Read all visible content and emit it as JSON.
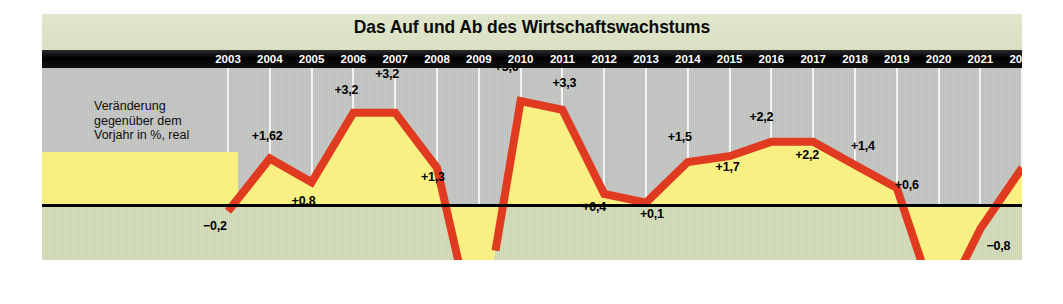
{
  "chart_title": "Das Auf und Ab des Wirtschaftswachstums",
  "legend": {
    "line1": "Veränderung",
    "line2": "gegenüber dem",
    "line3": "Vorjahr in %, real",
    "full": "Veränderung gegenüber dem Vorjahr in %, real"
  },
  "colors": {
    "line": "#e03a20",
    "fill": "#f9f083",
    "upper_background": "#c3c6c3",
    "lower_background": "#d3dcb9",
    "title_band": "#dde4c9",
    "year_bar": "#000000",
    "gridline": "#f2f4f2",
    "zero_line": "#000000",
    "legend_box": "#f7ef80",
    "label_text": "#000000"
  },
  "chart_data": {
    "type": "line",
    "title": "Das Auf und Ab des Wirtschaftswachstums",
    "xlabel": "",
    "ylabel": "Veränderung gegenüber dem Vorjahr in %, real",
    "ylim": [
      -5.4,
      4.2
    ],
    "grid": true,
    "legend_position": "inside-left",
    "categories": [
      "2003",
      "2004",
      "2005",
      "2006",
      "2007",
      "2008",
      "2009",
      "2010",
      "2011",
      "2012",
      "2013",
      "2014",
      "2015",
      "2016",
      "2017",
      "2018",
      "2019",
      "2020",
      "2021",
      "2022"
    ],
    "values": [
      -0.2,
      1.62,
      0.8,
      3.2,
      3.2,
      1.3,
      -5.0,
      3.6,
      3.3,
      0.4,
      0.1,
      1.5,
      1.7,
      2.2,
      2.2,
      1.4,
      0.6,
      -3.7,
      -0.8,
      1.3
    ],
    "point_labels": [
      "−0,2",
      "+1,62",
      "+0,8",
      "+3,2",
      "+3,2",
      "+1,3",
      "−5,0",
      "+3,6",
      "+3,3",
      "+0,4",
      "+0,1",
      "+1,5",
      "+1,7",
      "+2,2",
      "+2,2",
      "+1,4",
      "+0,6",
      "−3,7",
      "−0,8",
      "+1,3"
    ],
    "annotations": [
      {
        "text": "Linienunterbrechung 2009",
        "visible": false
      },
      {
        "text": "Linienunterbrechung 2020",
        "visible": false
      }
    ]
  },
  "years": [
    "2003",
    "2004",
    "2005",
    "2006",
    "2007",
    "2008",
    "2009",
    "2010",
    "2011",
    "2012",
    "2013",
    "2014",
    "2015",
    "2016",
    "2017",
    "2018",
    "2019",
    "2020",
    "2021",
    "2022"
  ],
  "point_labels": [
    "−0,2",
    "+1,62",
    "+0,8",
    "+3,2",
    "+3,2",
    "+1,3",
    "−5,0",
    "+3,6",
    "+3,3",
    "+0,4",
    "+0,1",
    "+1,5",
    "+1,7",
    "+2,2",
    "+2,2",
    "+1,4",
    "+0,6",
    "−3,7",
    "−0,8",
    "+1,3"
  ]
}
